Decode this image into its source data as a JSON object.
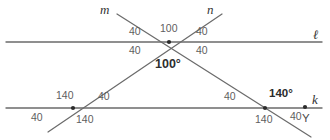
{
  "figure": {
    "background_color": "#ffffff",
    "line_color": "#6b6b6b",
    "label_color": "#5e5e5e",
    "emphasis_color": "#2b2b2b"
  },
  "lines": [
    {
      "id": "l",
      "label": "ℓ",
      "label_x": 313,
      "label_y": 28,
      "x1": 6,
      "y1": 42,
      "x2": 322,
      "y2": 42,
      "orientation": "horizontal"
    },
    {
      "id": "k",
      "label": "k",
      "label_x": 312,
      "label_y": 93,
      "x1": 6,
      "y1": 108,
      "x2": 322,
      "y2": 108,
      "orientation": "horizontal"
    },
    {
      "id": "m",
      "label": "m",
      "label_x": 100,
      "label_y": 3,
      "x1": 117,
      "y1": 14,
      "x2": 311,
      "y2": 137,
      "orientation": "transversal-down-right"
    },
    {
      "id": "n",
      "label": "n",
      "label_x": 207,
      "label_y": 3,
      "x1": 48,
      "y1": 132,
      "x2": 222,
      "y2": 14,
      "orientation": "transversal-up-right"
    }
  ],
  "vertices": [
    {
      "name": "top-intersection",
      "x": 169,
      "y": 42,
      "dot": true
    },
    {
      "name": "left-bottom-intersection",
      "x": 73,
      "y": 108,
      "dot": true
    },
    {
      "name": "right-bottom-intersection",
      "x": 265,
      "y": 108,
      "dot": true
    },
    {
      "name": "point-Y",
      "x": 305,
      "y": 107,
      "dot": true
    }
  ],
  "point_labels": [
    {
      "name": "point-label-Y",
      "text": "Y",
      "x": 302,
      "y": 113
    }
  ],
  "angle_labels": [
    {
      "name": "angle-top-upper-left",
      "text": "40",
      "x": 129,
      "y": 26,
      "style": "plain"
    },
    {
      "name": "angle-top-upper-mid",
      "text": "100",
      "x": 160,
      "y": 23,
      "style": "plain"
    },
    {
      "name": "angle-top-upper-right",
      "text": "40",
      "x": 196,
      "y": 26,
      "style": "plain"
    },
    {
      "name": "angle-top-lower-left",
      "text": "40",
      "x": 129,
      "y": 45,
      "style": "plain"
    },
    {
      "name": "angle-top-lower-right",
      "text": "40",
      "x": 196,
      "y": 45,
      "style": "plain"
    },
    {
      "name": "angle-center-main",
      "text": "100°",
      "x": 155,
      "y": 58,
      "style": "angle-main"
    },
    {
      "name": "angle-bl-upper-left",
      "text": "140",
      "x": 56,
      "y": 90,
      "style": "plain"
    },
    {
      "name": "angle-bl-upper-right",
      "text": "40",
      "x": 98,
      "y": 91,
      "style": "plain"
    },
    {
      "name": "angle-bl-lower-left",
      "text": "40",
      "x": 31,
      "y": 112,
      "style": "plain"
    },
    {
      "name": "angle-bl-lower-right",
      "text": "140",
      "x": 76,
      "y": 114,
      "style": "plain"
    },
    {
      "name": "angle-br-upper-left",
      "text": "40",
      "x": 224,
      "y": 91,
      "style": "plain"
    },
    {
      "name": "angle-br-upper-right",
      "text": "140°",
      "x": 269,
      "y": 88,
      "style": "angle-strong"
    },
    {
      "name": "angle-br-lower-left",
      "text": "140",
      "x": 255,
      "y": 114,
      "style": "plain"
    },
    {
      "name": "angle-br-lower-right",
      "text": "40",
      "x": 290,
      "y": 111,
      "style": "plain"
    }
  ],
  "chart_data": {
    "type": "diagram",
    "angles_deg": {
      "top_intersection": {
        "upper_left": 40,
        "upper_middle": 100,
        "upper_right": 40,
        "lower_left": 40,
        "lower_right": 40,
        "vertical_pair": 100
      },
      "left_bottom_intersection": {
        "upper_left": 140,
        "upper_right": 40,
        "lower_left": 40,
        "lower_right": 140
      },
      "right_bottom_intersection": {
        "upper_left": 40,
        "upper_right": 140,
        "lower_left": 140,
        "lower_right": 40
      }
    },
    "line_names": [
      "ℓ",
      "k",
      "m",
      "n"
    ],
    "points": [
      "Y"
    ]
  }
}
